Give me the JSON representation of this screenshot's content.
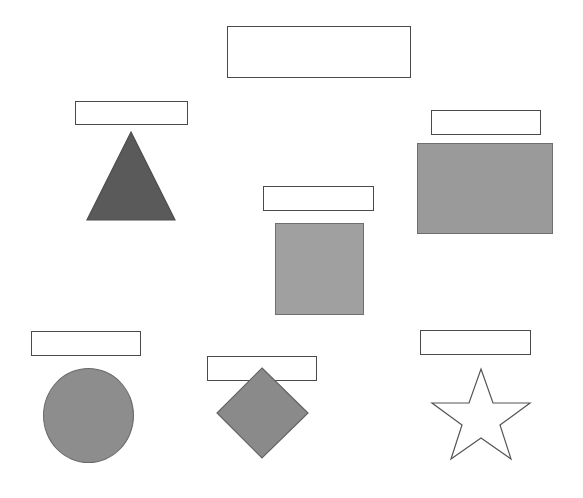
{
  "page": {
    "background_color": "#ffffff",
    "width": 583,
    "height": 498
  },
  "palette": {
    "box_border": "#4a4a4a",
    "box_fill": "#ffffff",
    "shape_outline": "#555555",
    "triangle_fill": "#5a5a5a",
    "square_fill": "#a0a0a0",
    "big_rect_fill": "#9a9a9a",
    "ellipse_fill": "#8d8d8d",
    "diamond_fill": "#8a8a8a",
    "star_fill": "#ffffff"
  },
  "label_boxes": [
    {
      "id": "box-top-center",
      "text": "",
      "x": 227,
      "y": 26,
      "w": 184,
      "h": 52
    },
    {
      "id": "box-triangle",
      "text": "",
      "x": 75,
      "y": 101,
      "w": 113,
      "h": 24
    },
    {
      "id": "box-big-rectangle",
      "text": "",
      "x": 431,
      "y": 110,
      "w": 110,
      "h": 25
    },
    {
      "id": "box-square",
      "text": "",
      "x": 263,
      "y": 186,
      "w": 111,
      "h": 25
    },
    {
      "id": "box-ellipse",
      "text": "",
      "x": 31,
      "y": 331,
      "w": 110,
      "h": 25
    },
    {
      "id": "box-diamond",
      "text": "",
      "x": 207,
      "y": 356,
      "w": 110,
      "h": 25
    },
    {
      "id": "box-star",
      "text": "",
      "x": 420,
      "y": 330,
      "w": 111,
      "h": 25
    }
  ],
  "shapes": [
    {
      "id": "triangle",
      "name": "triangle",
      "fill": "#5a5a5a",
      "stroke": "#4d4d4d",
      "x": 86,
      "y": 130,
      "w": 91,
      "h": 92,
      "points": "45,2 89,90 1,90"
    },
    {
      "id": "big-rectangle",
      "name": "rectangle",
      "fill": "#9a9a9a",
      "stroke": "#6f6f6f",
      "x": 417,
      "y": 143,
      "w": 136,
      "h": 91
    },
    {
      "id": "square",
      "name": "square",
      "fill": "#a0a0a0",
      "stroke": "#6f6f6f",
      "x": 275,
      "y": 223,
      "w": 89,
      "h": 92
    },
    {
      "id": "ellipse",
      "name": "circle",
      "fill": "#8d8d8d",
      "stroke": "#6a6a6a",
      "x": 43,
      "y": 368,
      "w": 91,
      "h": 95
    },
    {
      "id": "diamond",
      "name": "diamond",
      "fill": "#8a8a8a",
      "stroke": "#636363",
      "x": 216,
      "y": 367,
      "w": 93,
      "h": 93,
      "points": "46,1 92,46 46,91 1,46"
    },
    {
      "id": "star",
      "name": "star",
      "fill": "#ffffff",
      "stroke": "#555555",
      "x": 426,
      "y": 368,
      "w": 110,
      "h": 92,
      "points": "55,1 67,35 104,35 74,57 85,91 55,70 25,91 36,57 6,35 43,35"
    }
  ]
}
